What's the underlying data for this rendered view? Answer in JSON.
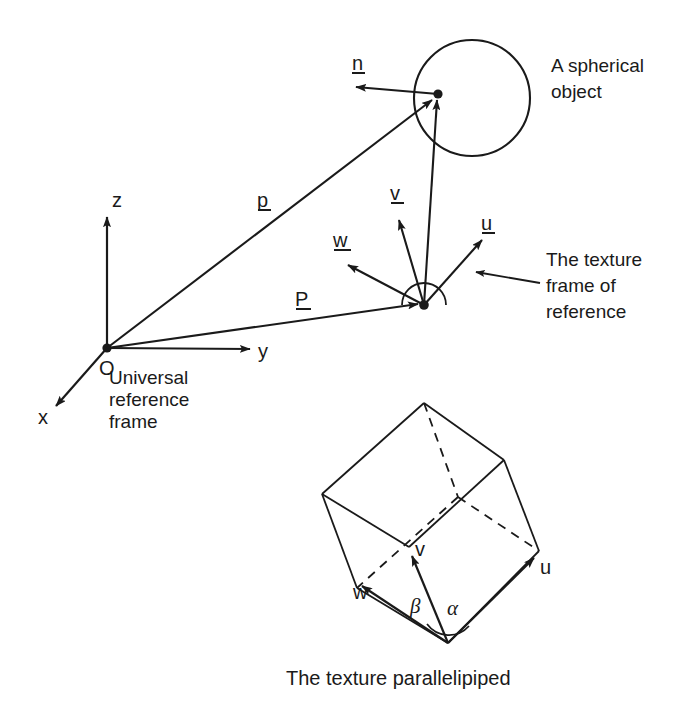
{
  "figure": {
    "background_color": "#ffffff",
    "ink_color": "#1a1a1a",
    "width": 682,
    "height": 706
  },
  "axes": {
    "origin_label": "O",
    "x_label": "x",
    "y_label": "y",
    "z_label": "z",
    "caption_line1": "Universal",
    "caption_line2": "reference",
    "caption_line3": "frame"
  },
  "vectors": {
    "position_lower": "p",
    "position_upper": "P",
    "normal": "n",
    "u": "u",
    "v": "v",
    "w": "w"
  },
  "annotations": {
    "sphere_line1": "A spherical",
    "sphere_line2": "object",
    "frame_line1": "The texture",
    "frame_line2": "frame of",
    "frame_line3": "reference"
  },
  "parallelipiped": {
    "caption": "The texture parallelipiped",
    "u_label": "u",
    "v_label": "v",
    "w_label": "w",
    "alpha_label": "α",
    "beta_label": "β"
  },
  "geometry": {
    "world_origin": [
      107,
      348
    ],
    "sphere_center": [
      472,
      98
    ],
    "sphere_radius": 58,
    "surface_point": [
      438,
      94
    ],
    "texture_origin": [
      424,
      305
    ],
    "parallelipiped_bottom_vertex": [
      448,
      643
    ]
  }
}
